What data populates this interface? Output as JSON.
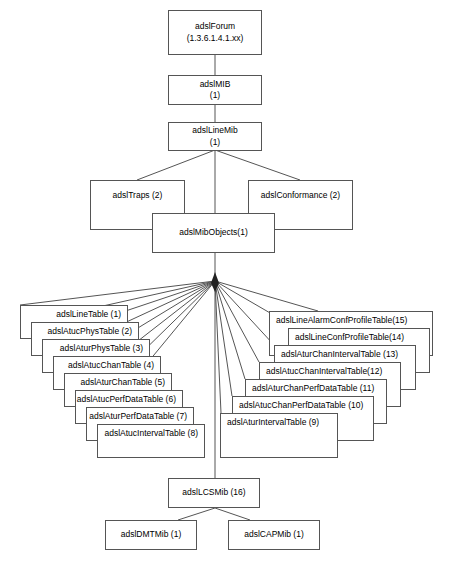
{
  "diagram": {
    "background": "#ffffff",
    "stroke": "#555555",
    "text_color": "#000000",
    "root": {
      "line1": "adslForum",
      "line2": "(1.3.6.1.4.1.xx)"
    },
    "nodes": {
      "adsl_mib": {
        "line1": "adslMIB",
        "line2": "(1)"
      },
      "adsl_line_mib": {
        "line1": "adslLineMib",
        "line2": "(1)"
      },
      "adsl_traps": {
        "line1": "adslTraps (2)"
      },
      "adsl_conformance": {
        "line1": "adslConformance (2)"
      },
      "adsl_mib_objects": {
        "line1": "adslMibObjects(1)"
      },
      "adsl_lcs_mib": {
        "line1": "adslLCSMib (16)"
      },
      "adsl_dmt_mib": {
        "line1": "adslDMTMib (1)"
      },
      "adsl_cap_mib": {
        "line1": "adslCAPMib (1)"
      }
    },
    "left_stack": [
      {
        "label": "adslLineTable  (1)"
      },
      {
        "label": "adslAtucPhysTable (2)"
      },
      {
        "label": "adslAturPhysTable (3)"
      },
      {
        "label": "adslAtucChanTable (4)"
      },
      {
        "label": "adslAturChanTable (5)"
      },
      {
        "label": "adslAtucPerfDataTable (6)"
      },
      {
        "label": "adslAturPerfDataTable (7)"
      },
      {
        "label": "adslAtucIntervalTable (8)"
      }
    ],
    "right_stack": [
      {
        "label": "adslLineAlarmConfProfileTable(15)"
      },
      {
        "label": "adslLineConfProfileTable(14)"
      },
      {
        "label": "adslAturChanIntervalTable (13)"
      },
      {
        "label": "adslAtucChanIntervalTable(12)"
      },
      {
        "label": "adslAturChanPerfDataTable (11)"
      },
      {
        "label": "adslAtucChanPerfDataTable (10)"
      },
      {
        "label": "adslAturIntervalTable (9)"
      }
    ]
  }
}
